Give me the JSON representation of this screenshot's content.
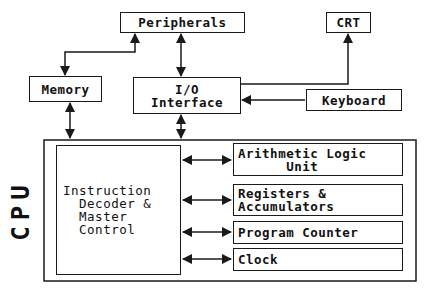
{
  "diagram": {
    "cpu_label": "CPU",
    "nodes": {
      "peripherals": "Peripherals",
      "crt": "CRT",
      "memory": "Memory",
      "io_interface": "I/O\nInterface",
      "keyboard": "Keyboard",
      "instruction_decoder": "Instruction\n  Decoder &\n  Master\n  Control",
      "alu": "Arithmetic Logic\n      Unit",
      "registers": "Registers &\nAccumulators",
      "program_counter": "Program Counter",
      "clock": "Clock"
    },
    "edges": [
      {
        "from": "peripherals",
        "to": "memory",
        "type": "bidirectional"
      },
      {
        "from": "peripherals",
        "to": "io_interface",
        "type": "bidirectional"
      },
      {
        "from": "io_interface",
        "to": "crt",
        "type": "directed"
      },
      {
        "from": "keyboard",
        "to": "io_interface",
        "type": "directed"
      },
      {
        "from": "memory",
        "to": "cpu",
        "type": "bidirectional"
      },
      {
        "from": "io_interface",
        "to": "cpu",
        "type": "bidirectional"
      },
      {
        "from": "instruction_decoder",
        "to": "alu",
        "type": "bidirectional"
      },
      {
        "from": "instruction_decoder",
        "to": "registers",
        "type": "bidirectional"
      },
      {
        "from": "instruction_decoder",
        "to": "program_counter",
        "type": "bidirectional"
      },
      {
        "from": "instruction_decoder",
        "to": "clock",
        "type": "bidirectional"
      }
    ],
    "colors": {
      "line": "#1a1a1a",
      "background": "#ffffff"
    }
  }
}
